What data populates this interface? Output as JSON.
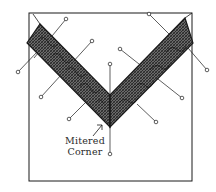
{
  "diagram": {
    "annotation": {
      "line1": "Mitered",
      "line2": "Corner"
    },
    "colors": {
      "ink": "#1a1a1a",
      "paper": "#ffffff",
      "band_fill": "#4a4a4a"
    }
  }
}
